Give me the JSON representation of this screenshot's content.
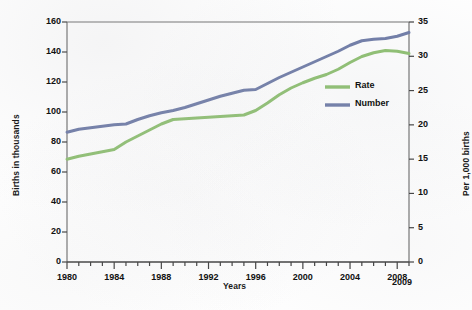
{
  "chart_data": {
    "type": "line",
    "title": "",
    "xlabel": "Years",
    "ylabel": "Births in thousands",
    "ylabel_right": "Per 1,000 births",
    "grid": false,
    "legend_position": "center-right",
    "xlim": [
      1980,
      2009
    ],
    "ylim": [
      0,
      160
    ],
    "ylim_right": [
      0,
      35
    ],
    "x_ticks": [
      1980,
      1984,
      1988,
      1992,
      1996,
      2000,
      2004,
      2008
    ],
    "x_tick_labels": [
      "1980",
      "1984",
      "1988",
      "1992",
      "1996",
      "2000",
      "2004",
      "2008"
    ],
    "x_end_label": "2009",
    "x_minor_tick_interval": 1,
    "y_ticks_left": [
      0,
      20,
      40,
      60,
      80,
      100,
      120,
      140,
      160
    ],
    "y_tick_labels_left": [
      "0",
      "20",
      "40",
      "60",
      "80",
      "100",
      "120",
      "140",
      "160"
    ],
    "y_ticks_right": [
      0,
      5,
      10,
      15,
      20,
      25,
      30,
      35
    ],
    "y_tick_labels_right": [
      "0",
      "5",
      "10",
      "15",
      "20",
      "25",
      "30",
      "35"
    ],
    "x": [
      1980,
      1981,
      1982,
      1983,
      1984,
      1985,
      1986,
      1987,
      1988,
      1989,
      1990,
      1991,
      1992,
      1993,
      1994,
      1995,
      1996,
      1997,
      1998,
      1999,
      2000,
      2001,
      2002,
      2003,
      2004,
      2005,
      2006,
      2007,
      2008,
      2009
    ],
    "series": [
      {
        "name": "Number",
        "axis": "left",
        "color": "#6d7aa6",
        "unit": "thousands",
        "values": [
          86.5,
          88.5,
          89.5,
          90.5,
          91.5,
          92.0,
          95.0,
          97.5,
          99.5,
          101.0,
          103.0,
          105.5,
          108.0,
          110.5,
          112.5,
          114.5,
          115.0,
          119.0,
          123.0,
          126.5,
          130.0,
          133.5,
          137.0,
          140.5,
          144.5,
          147.5,
          148.5,
          149.0,
          150.5,
          153.0
        ]
      },
      {
        "name": "Rate",
        "axis": "right",
        "color": "#8cbf6e",
        "unit": "per 1,000 births",
        "values_left_scale": [
          68.5,
          70.5,
          72.0,
          73.5,
          75.0,
          80.0,
          84.0,
          88.0,
          92.0,
          95.0,
          95.5,
          96.0,
          96.5,
          97.0,
          97.5,
          98.0,
          101.0,
          106.0,
          111.5,
          116.0,
          119.5,
          122.5,
          125.0,
          128.5,
          133.0,
          137.0,
          139.5,
          141.0,
          140.5,
          139.0
        ],
        "values": [
          15.0,
          15.4,
          15.8,
          16.1,
          16.4,
          17.5,
          18.4,
          19.3,
          20.1,
          20.8,
          20.9,
          21.0,
          21.1,
          21.2,
          21.3,
          21.4,
          22.1,
          23.2,
          24.4,
          25.4,
          26.1,
          26.8,
          27.3,
          28.1,
          29.1,
          30.0,
          30.5,
          30.8,
          30.7,
          30.4
        ]
      }
    ],
    "legend": [
      {
        "label": "Rate",
        "color": "#8cbf6e"
      },
      {
        "label": "Number",
        "color": "#6d7aa6"
      }
    ]
  }
}
